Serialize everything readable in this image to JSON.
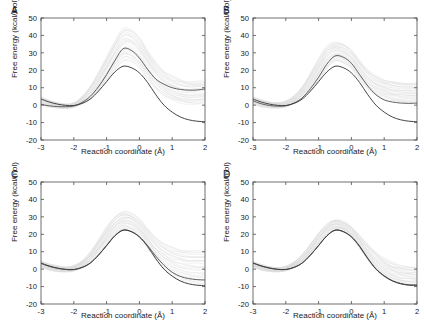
{
  "figure": {
    "background": "#ffffff",
    "panels": [
      {
        "letter": "A",
        "id": "panel-a"
      },
      {
        "letter": "B",
        "id": "panel-b"
      },
      {
        "letter": "C",
        "id": "panel-c"
      },
      {
        "letter": "D",
        "id": "panel-d"
      }
    ]
  },
  "axes": {
    "xlabel": "Reaction coordinate (Å)",
    "ylabel": "Free energy (kcal/mol)",
    "xticks": [
      "-3",
      "-2",
      "-1",
      "0",
      "1",
      "2"
    ],
    "yticks": [
      "50",
      "40",
      "30",
      "20",
      "10",
      "0",
      "-10",
      "-20"
    ],
    "xlim": [
      -3,
      2
    ],
    "ylim": [
      -20,
      50
    ]
  },
  "colors": {
    "curve_dark": "#3a3a3a",
    "curve_mid": "#5a5a5a",
    "ensemble_gray": "#d4d4d4",
    "axis": "#4d4d4d",
    "text": "#1a1a1a"
  },
  "chart_data": [
    {
      "type": "line",
      "title": "A",
      "xlabel": "Reaction coordinate (Å)",
      "ylabel": "Free energy (kcal/mol)",
      "xlim": [
        -3,
        2
      ],
      "ylim": [
        -20,
        50
      ],
      "grid": false,
      "legend": "none",
      "x": [
        -3.0,
        -2.75,
        -2.5,
        -2.25,
        -2.0,
        -1.75,
        -1.5,
        -1.25,
        -1.0,
        -0.75,
        -0.5,
        -0.25,
        0.0,
        0.25,
        0.5,
        0.75,
        1.0,
        1.25,
        1.5,
        1.75,
        2.0
      ],
      "series": [
        {
          "name": "upper-mean-curve",
          "style": "dark-solid",
          "values": [
            0.5,
            -0.4,
            -0.8,
            -0.9,
            -0.5,
            1.5,
            5.0,
            10.5,
            17.5,
            25.5,
            32.3,
            31.5,
            27.0,
            20.5,
            15.0,
            12.0,
            10.0,
            9.0,
            8.6,
            8.7,
            9.3
          ]
        },
        {
          "name": "lower-mean-curve",
          "style": "dark-solid",
          "values": [
            3.5,
            1.8,
            0.6,
            -0.1,
            -0.2,
            1.0,
            3.5,
            8.0,
            13.5,
            19.0,
            22.3,
            21.5,
            18.5,
            13.0,
            6.0,
            0.0,
            -4.0,
            -6.8,
            -8.4,
            -9.2,
            -9.5
          ]
        },
        {
          "name": "ensemble-upper-envelope",
          "style": "light-gray",
          "values": [
            5.0,
            3.0,
            1.5,
            0.8,
            1.5,
            5.0,
            11.0,
            19.0,
            28.0,
            37.0,
            44.5,
            44.0,
            39.5,
            32.0,
            25.0,
            20.0,
            17.0,
            15.0,
            14.0,
            14.0,
            14.5
          ]
        },
        {
          "name": "ensemble-lower-envelope",
          "style": "light-gray",
          "values": [
            0.0,
            -1.2,
            -1.8,
            -2.0,
            -1.5,
            0.5,
            3.0,
            7.5,
            13.0,
            19.5,
            25.0,
            24.5,
            21.0,
            15.0,
            9.0,
            5.0,
            2.5,
            1.0,
            0.5,
            0.5,
            1.0
          ]
        }
      ]
    },
    {
      "type": "line",
      "title": "B",
      "xlabel": "Reaction coordinate (Å)",
      "ylabel": "Free energy (kcal/mol)",
      "xlim": [
        -3,
        2
      ],
      "ylim": [
        -20,
        50
      ],
      "grid": false,
      "legend": "none",
      "x": [
        -3.0,
        -2.75,
        -2.5,
        -2.25,
        -2.0,
        -1.75,
        -1.5,
        -1.25,
        -1.0,
        -0.75,
        -0.5,
        -0.25,
        0.0,
        0.25,
        0.5,
        0.75,
        1.0,
        1.25,
        1.5,
        1.75,
        2.0
      ],
      "series": [
        {
          "name": "upper-mean-curve",
          "style": "dark-solid",
          "values": [
            2.5,
            0.8,
            -0.2,
            -0.6,
            -0.4,
            1.2,
            4.2,
            9.5,
            16.0,
            23.5,
            28.2,
            27.5,
            24.0,
            17.5,
            11.0,
            6.0,
            3.0,
            1.8,
            1.2,
            1.0,
            1.2
          ]
        },
        {
          "name": "lower-mean-curve",
          "style": "dark-solid",
          "values": [
            3.5,
            1.8,
            0.6,
            -0.1,
            -0.2,
            1.0,
            3.5,
            8.0,
            13.5,
            19.0,
            22.3,
            21.5,
            18.5,
            13.0,
            6.0,
            0.0,
            -4.0,
            -6.8,
            -8.4,
            -9.2,
            -9.5
          ]
        },
        {
          "name": "ensemble-upper-envelope",
          "style": "light-gray",
          "values": [
            5.0,
            3.2,
            2.0,
            1.5,
            2.5,
            5.5,
            11.0,
            18.5,
            27.0,
            34.0,
            36.5,
            35.5,
            32.0,
            26.0,
            20.5,
            17.0,
            15.0,
            13.8,
            13.2,
            13.0,
            13.2
          ]
        },
        {
          "name": "ensemble-lower-envelope",
          "style": "light-gray",
          "values": [
            0.5,
            -1.0,
            -1.6,
            -1.8,
            -1.2,
            0.8,
            3.5,
            8.0,
            14.0,
            20.5,
            25.0,
            24.0,
            20.5,
            14.5,
            9.0,
            5.5,
            3.5,
            2.2,
            1.5,
            1.2,
            1.5
          ]
        }
      ]
    },
    {
      "type": "line",
      "title": "C",
      "xlabel": "Reaction coordinate (Å)",
      "ylabel": "Free energy (kcal/mol)",
      "xlim": [
        -3,
        2
      ],
      "ylim": [
        -20,
        50
      ],
      "grid": false,
      "legend": "none",
      "x": [
        -3.0,
        -2.75,
        -2.5,
        -2.25,
        -2.0,
        -1.75,
        -1.5,
        -1.25,
        -1.0,
        -0.75,
        -0.5,
        -0.25,
        0.0,
        0.25,
        0.5,
        0.75,
        1.0,
        1.25,
        1.5,
        1.75,
        2.0
      ],
      "series": [
        {
          "name": "upper-mean-curve",
          "style": "dark-solid",
          "values": [
            3.3,
            1.6,
            0.5,
            -0.2,
            -0.3,
            0.9,
            3.4,
            8.0,
            13.6,
            19.2,
            22.4,
            21.6,
            18.6,
            13.5,
            7.5,
            2.2,
            -1.8,
            -4.2,
            -5.4,
            -6.0,
            -6.2
          ]
        },
        {
          "name": "lower-mean-curve",
          "style": "dark-solid",
          "values": [
            3.5,
            1.8,
            0.6,
            -0.1,
            -0.2,
            1.0,
            3.5,
            8.0,
            13.5,
            19.0,
            22.3,
            21.5,
            18.5,
            13.0,
            6.0,
            0.0,
            -4.0,
            -6.8,
            -8.4,
            -9.2,
            -9.5
          ]
        },
        {
          "name": "ensemble-upper-envelope",
          "style": "light-gray",
          "values": [
            5.0,
            3.2,
            2.0,
            1.4,
            2.2,
            5.0,
            10.0,
            17.0,
            24.5,
            30.5,
            33.5,
            32.5,
            29.0,
            23.5,
            18.5,
            15.0,
            13.0,
            11.8,
            11.2,
            11.0,
            11.2
          ]
        },
        {
          "name": "ensemble-lower-envelope",
          "style": "light-gray",
          "values": [
            1.0,
            -0.8,
            -1.5,
            -1.8,
            -1.2,
            0.8,
            3.2,
            7.8,
            13.2,
            18.8,
            22.0,
            21.0,
            17.5,
            11.5,
            5.0,
            -0.5,
            -4.5,
            -7.0,
            -8.5,
            -9.2,
            -9.5
          ]
        }
      ]
    },
    {
      "type": "line",
      "title": "D",
      "xlabel": "Reaction coordinate (Å)",
      "ylabel": "Free energy (kcal/mol)",
      "xlim": [
        -3,
        2
      ],
      "ylim": [
        -20,
        50
      ],
      "grid": false,
      "legend": "none",
      "x": [
        -3.0,
        -2.75,
        -2.5,
        -2.25,
        -2.0,
        -1.75,
        -1.5,
        -1.25,
        -1.0,
        -0.75,
        -0.5,
        -0.25,
        0.0,
        0.25,
        0.5,
        0.75,
        1.0,
        1.25,
        1.5,
        1.75,
        2.0
      ],
      "series": [
        {
          "name": "upper-mean-curve",
          "style": "dark-solid",
          "values": [
            3.6,
            1.9,
            0.7,
            -0.1,
            -0.2,
            1.0,
            3.5,
            8.1,
            13.6,
            19.1,
            22.4,
            21.6,
            18.6,
            13.2,
            6.2,
            0.2,
            -3.8,
            -6.6,
            -8.2,
            -9.0,
            -9.0
          ]
        },
        {
          "name": "lower-mean-curve",
          "style": "dark-solid",
          "values": [
            3.5,
            1.8,
            0.6,
            -0.1,
            -0.2,
            1.0,
            3.5,
            8.0,
            13.5,
            19.0,
            22.3,
            21.5,
            18.5,
            13.0,
            6.0,
            0.0,
            -4.0,
            -6.8,
            -8.4,
            -9.2,
            -9.3
          ]
        },
        {
          "name": "ensemble-upper-envelope",
          "style": "light-gray",
          "values": [
            4.5,
            2.8,
            1.6,
            1.0,
            1.8,
            4.2,
            8.5,
            14.5,
            21.0,
            26.0,
            28.5,
            27.5,
            24.5,
            19.5,
            14.5,
            10.0,
            6.5,
            4.0,
            2.5,
            1.8,
            1.6
          ]
        },
        {
          "name": "ensemble-lower-envelope",
          "style": "light-gray",
          "values": [
            1.2,
            -0.6,
            -1.4,
            -1.7,
            -1.1,
            0.9,
            3.3,
            7.9,
            13.3,
            18.9,
            22.1,
            21.2,
            17.8,
            11.8,
            5.2,
            -0.6,
            -4.6,
            -7.2,
            -8.8,
            -9.5,
            -9.6
          ]
        }
      ]
    }
  ]
}
